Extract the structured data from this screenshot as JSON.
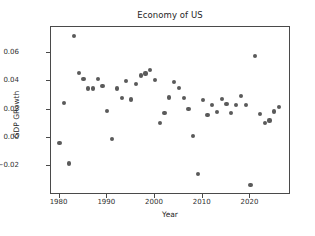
{
  "chart_data": {
    "type": "scatter",
    "title": "Economy of US",
    "xlabel": "Year",
    "ylabel": "GDP GRowth",
    "xlim": [
      1978.2,
      1978.2
    ],
    "x_range": [
      1978.2,
      2028.5
    ],
    "y_range": [
      -0.0405,
      0.0785
    ],
    "xticks": [
      1980,
      1990,
      2000,
      2010,
      2020
    ],
    "xtick_labels": [
      "1980",
      "1990",
      "2000",
      "2010",
      "2020"
    ],
    "yticks": [
      0.06,
      0.04,
      0.02,
      0.0,
      -0.02
    ],
    "ytick_labels": [
      "0.06",
      "0.04",
      "0.02",
      "0.00",
      "−0.02"
    ],
    "grid": false,
    "legend": null,
    "marker_color": "#5a5a5a",
    "x": [
      1980,
      1981,
      1982,
      1983,
      1984,
      1985,
      1986,
      1987,
      1988,
      1989,
      1990,
      1991,
      1992,
      1993,
      1994,
      1995,
      1996,
      1997,
      1998,
      1999,
      2000,
      2001,
      2002,
      2003,
      2004,
      2005,
      2006,
      2007,
      2008,
      2009,
      2010,
      2011,
      2012,
      2013,
      2014,
      2015,
      2016,
      2017,
      2018,
      2019,
      2020,
      2021,
      2022,
      2023,
      2024,
      2025,
      2026
    ],
    "y": [
      -0.0035,
      0.0248,
      -0.0182,
      0.0719,
      0.0458,
      0.0418,
      0.035,
      0.035,
      0.0418,
      0.0367,
      0.0192,
      -0.0009,
      0.0349,
      0.0281,
      0.0402,
      0.0271,
      0.0379,
      0.0442,
      0.0455,
      0.048,
      0.041,
      0.0104,
      0.0173,
      0.0285,
      0.0394,
      0.0352,
      0.0284,
      0.0203,
      0.0012,
      -0.0259,
      0.027,
      0.0164,
      0.0232,
      0.0185,
      0.0276,
      0.0238,
      0.0175,
      0.0232,
      0.0294,
      0.0234,
      -0.0334,
      0.0578,
      0.0166,
      0.0107,
      0.0123,
      0.0186,
      0.0218
    ],
    "points": [
      {
        "year": 1980,
        "value": -0.0035
      },
      {
        "year": 1981,
        "value": 0.0248
      },
      {
        "year": 1982,
        "value": -0.0182
      },
      {
        "year": 1983,
        "value": 0.0719
      },
      {
        "year": 1984,
        "value": 0.0458
      },
      {
        "year": 1985,
        "value": 0.0418
      },
      {
        "year": 1986,
        "value": 0.035
      },
      {
        "year": 1987,
        "value": 0.035
      },
      {
        "year": 1988,
        "value": 0.0418
      },
      {
        "year": 1989,
        "value": 0.0367
      },
      {
        "year": 1990,
        "value": 0.0192
      },
      {
        "year": 1991,
        "value": -0.0009
      },
      {
        "year": 1992,
        "value": 0.0349
      },
      {
        "year": 1993,
        "value": 0.0281
      },
      {
        "year": 1994,
        "value": 0.0402
      },
      {
        "year": 1995,
        "value": 0.0271
      },
      {
        "year": 1996,
        "value": 0.0379
      },
      {
        "year": 1997,
        "value": 0.0442
      },
      {
        "year": 1998,
        "value": 0.0455
      },
      {
        "year": 1999,
        "value": 0.048
      },
      {
        "year": 2000,
        "value": 0.041
      },
      {
        "year": 2001,
        "value": 0.0104
      },
      {
        "year": 2002,
        "value": 0.0173
      },
      {
        "year": 2003,
        "value": 0.0285
      },
      {
        "year": 2004,
        "value": 0.0394
      },
      {
        "year": 2005,
        "value": 0.0352
      },
      {
        "year": 2006,
        "value": 0.0284
      },
      {
        "year": 2007,
        "value": 0.0203
      },
      {
        "year": 2008,
        "value": 0.0012
      },
      {
        "year": 2009,
        "value": -0.0259
      },
      {
        "year": 2010,
        "value": 0.027
      },
      {
        "year": 2011,
        "value": 0.0164
      },
      {
        "year": 2012,
        "value": 0.0232
      },
      {
        "year": 2013,
        "value": 0.0185
      },
      {
        "year": 2014,
        "value": 0.0276
      },
      {
        "year": 2015,
        "value": 0.0238
      },
      {
        "year": 2016,
        "value": 0.0175
      },
      {
        "year": 2017,
        "value": 0.0232
      },
      {
        "year": 2018,
        "value": 0.0294
      },
      {
        "year": 2019,
        "value": 0.0234
      },
      {
        "year": 2020,
        "value": -0.0334
      },
      {
        "year": 2021,
        "value": 0.0578
      },
      {
        "year": 2022,
        "value": 0.0166
      },
      {
        "year": 2023,
        "value": 0.0107
      },
      {
        "year": 2024,
        "value": 0.0123
      },
      {
        "year": 2025,
        "value": 0.0186
      },
      {
        "year": 2026,
        "value": 0.0218
      }
    ]
  }
}
